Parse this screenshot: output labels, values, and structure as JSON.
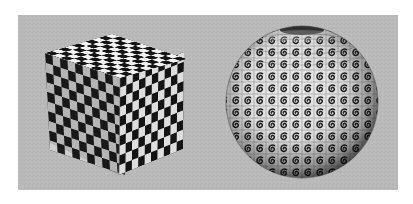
{
  "scene": {
    "description": "3D render of a checkerboard-textured cube beside a sphere textured with a repeating spiral glyph grid",
    "background_color": "#ffffff",
    "panel_color": "#b9b9b9",
    "objects": [
      {
        "name": "cube",
        "texture": "checkerboard",
        "grid": 10,
        "dark": "#1a1a1a",
        "light": "#d6d6d6"
      },
      {
        "name": "sphere",
        "texture": "spiral-tiles",
        "tile_bg": "#e8e8e8",
        "glyph_color": "#202020"
      }
    ]
  }
}
